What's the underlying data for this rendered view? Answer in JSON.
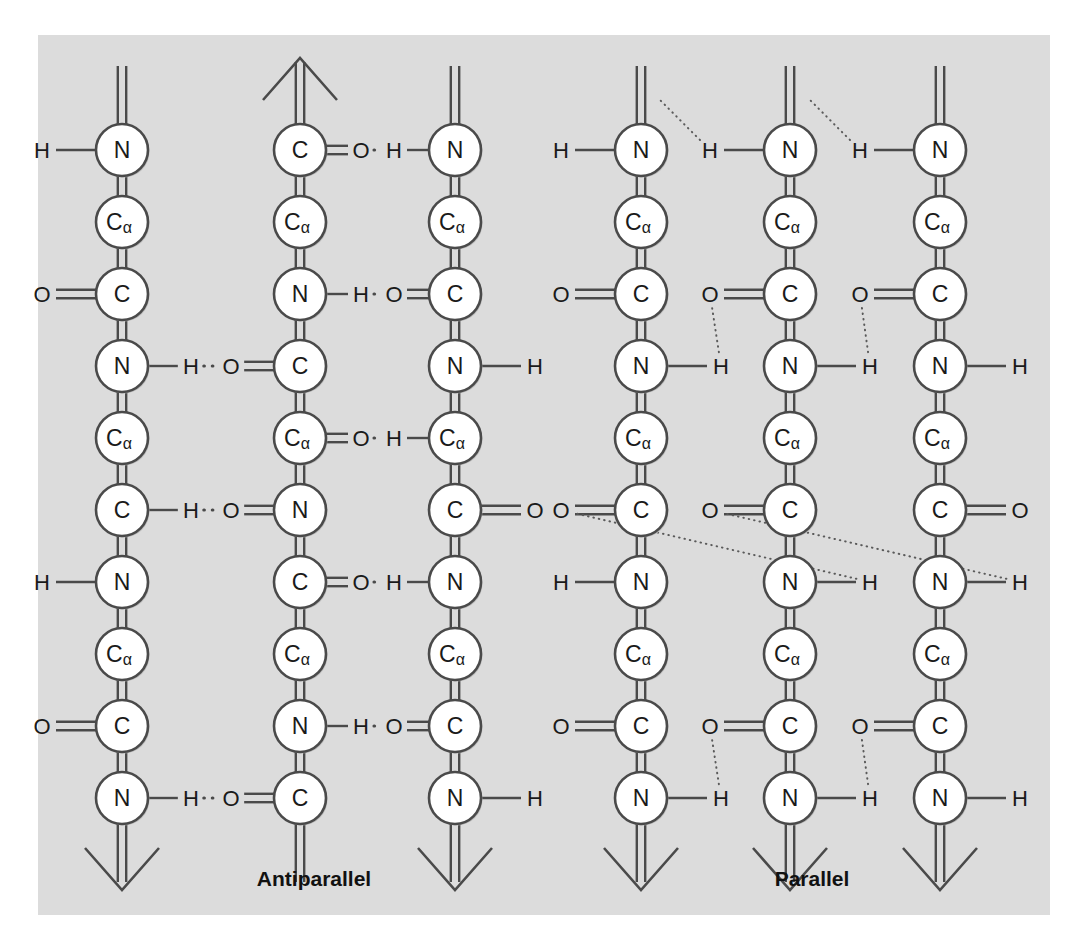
{
  "figure": {
    "background_color": "#ffffff",
    "panel_color": "#dcdcdc",
    "stroke_color": "#4a4a4a",
    "node_fill": "#ffffff",
    "text_color": "#1a1a1a"
  },
  "sections": [
    {
      "id": "antiparallel",
      "label": "Antiparallel",
      "label_x": 314,
      "label_y": 878
    },
    {
      "id": "parallel",
      "label": "Parallel",
      "label_x": 812,
      "label_y": 878
    }
  ],
  "geometry": {
    "node_radius": 26,
    "node_spacing_y": 72,
    "first_node_y": 150,
    "nodes_per_chain": 10,
    "chain_x": [
      122,
      300,
      455,
      641,
      790,
      940
    ]
  },
  "chains": [
    {
      "id": "antiparallel-chain-1",
      "section": "antiparallel",
      "x": 122,
      "direction": "down",
      "top_stub": "double-line",
      "bottom_arrow": "down",
      "nodes": [
        "N",
        "Ca",
        "C",
        "N",
        "Ca",
        "C",
        "N",
        "Ca",
        "C",
        "N"
      ]
    },
    {
      "id": "antiparallel-chain-2",
      "section": "antiparallel",
      "x": 300,
      "direction": "up",
      "top_stub": "double-line",
      "top_arrow": "up",
      "nodes": [
        "C",
        "Ca",
        "N",
        "C",
        "Ca",
        "N",
        "C",
        "Ca",
        "N",
        "C"
      ]
    },
    {
      "id": "antiparallel-chain-3",
      "section": "antiparallel",
      "x": 455,
      "direction": "down",
      "top_stub": "double-line",
      "bottom_arrow": "down",
      "nodes": [
        "N",
        "Ca",
        "C",
        "N",
        "Ca",
        "C",
        "N",
        "Ca",
        "C",
        "N"
      ]
    },
    {
      "id": "parallel-chain-1",
      "section": "parallel",
      "x": 641,
      "direction": "down",
      "top_stub": "double-line",
      "bottom_arrow": "down",
      "nodes": [
        "N",
        "Ca",
        "C",
        "N",
        "Ca",
        "C",
        "N",
        "Ca",
        "C",
        "N"
      ]
    },
    {
      "id": "parallel-chain-2",
      "section": "parallel",
      "x": 790,
      "direction": "down",
      "top_stub": "double-line",
      "bottom_arrow": "down",
      "nodes": [
        "N",
        "Ca",
        "C",
        "N",
        "Ca",
        "C",
        "N",
        "Ca",
        "C",
        "N"
      ]
    },
    {
      "id": "parallel-chain-3",
      "section": "parallel",
      "x": 940,
      "direction": "down",
      "top_stub": "double-line",
      "bottom_arrow": "down",
      "nodes": [
        "N",
        "Ca",
        "C",
        "N",
        "Ca",
        "C",
        "N",
        "Ca",
        "C",
        "N"
      ]
    }
  ],
  "substituents": [
    {
      "chain": 0,
      "node_index": 0,
      "side": "left",
      "atom": "H",
      "bond": "single"
    },
    {
      "chain": 0,
      "node_index": 2,
      "side": "left",
      "atom": "O",
      "bond": "double"
    },
    {
      "chain": 0,
      "node_index": 6,
      "side": "left",
      "atom": "H",
      "bond": "single"
    },
    {
      "chain": 0,
      "node_index": 8,
      "side": "left",
      "atom": "O",
      "bond": "double"
    },
    {
      "chain": 2,
      "node_index": 3,
      "side": "right",
      "atom": "H",
      "bond": "single"
    },
    {
      "chain": 2,
      "node_index": 5,
      "side": "right",
      "atom": "O",
      "bond": "double"
    },
    {
      "chain": 2,
      "node_index": 9,
      "side": "right",
      "atom": "H",
      "bond": "single"
    },
    {
      "chain": 3,
      "node_index": 0,
      "side": "left",
      "atom": "H",
      "bond": "single"
    },
    {
      "chain": 3,
      "node_index": 2,
      "side": "left",
      "atom": "O",
      "bond": "double"
    },
    {
      "chain": 3,
      "node_index": 6,
      "side": "left",
      "atom": "H",
      "bond": "single"
    },
    {
      "chain": 3,
      "node_index": 8,
      "side": "left",
      "atom": "O",
      "bond": "double"
    },
    {
      "chain": 5,
      "node_index": 3,
      "side": "right",
      "atom": "H",
      "bond": "single"
    },
    {
      "chain": 5,
      "node_index": 5,
      "side": "right",
      "atom": "O",
      "bond": "double"
    },
    {
      "chain": 5,
      "node_index": 9,
      "side": "right",
      "atom": "H",
      "bond": "single"
    }
  ],
  "antiparallel_hbonds": [
    {
      "left_chain": 1,
      "left_node": 0,
      "right_chain": 2,
      "right_node": 0,
      "left_atom": "O",
      "right_atom": "H",
      "left_bond": "double",
      "right_bond": "single"
    },
    {
      "left_chain": 1,
      "left_node": 2,
      "right_chain": 2,
      "right_node": 2,
      "left_atom": "H",
      "right_atom": "O",
      "left_bond": "single",
      "right_bond": "double"
    },
    {
      "left_chain": 0,
      "left_node": 3,
      "right_chain": 1,
      "right_node": 3,
      "left_atom": "H",
      "right_atom": "O",
      "left_bond": "single",
      "right_bond": "double"
    },
    {
      "left_chain": 1,
      "left_node": 4,
      "right_chain": 2,
      "right_node": 4,
      "left_atom": "O",
      "right_atom": "H",
      "left_bond": "double",
      "right_bond": "single"
    },
    {
      "left_chain": 1,
      "left_node": 6,
      "right_chain": 2,
      "right_node": 6,
      "left_atom": "O",
      "right_atom": "H",
      "left_bond": "double",
      "right_bond": "single"
    },
    {
      "left_chain": 0,
      "left_node": 5,
      "right_chain": 1,
      "right_node": 5,
      "left_atom": "H",
      "right_atom": "O",
      "left_bond": "single",
      "right_bond": "double"
    },
    {
      "left_chain": 1,
      "left_node": 8,
      "right_chain": 2,
      "right_node": 8,
      "left_atom": "H",
      "right_atom": "O",
      "left_bond": "single",
      "right_bond": "double"
    },
    {
      "left_chain": 0,
      "left_node": 9,
      "right_chain": 1,
      "right_node": 9,
      "left_atom": "H",
      "right_atom": "O",
      "left_bond": "single",
      "right_bond": "double"
    }
  ],
  "parallel_hbonds": [
    {
      "donor_chain": 4,
      "donor_node": 0,
      "acceptor": "stub-above",
      "atom": "H"
    },
    {
      "donor_chain": 5,
      "donor_node": 0,
      "acceptor": "stub-above",
      "atom": "H"
    },
    {
      "carbonyl_chain": 4,
      "carbonyl_node": 2,
      "amide_chain": 3,
      "amide_node": 3,
      "o_atom": "O",
      "h_atom": "H"
    },
    {
      "carbonyl_chain": 5,
      "carbonyl_node": 2,
      "amide_chain": 4,
      "amide_node": 3,
      "o_atom": "O",
      "h_atom": "H"
    },
    {
      "carbonyl_chain": 3,
      "carbonyl_node": 5,
      "amide_chain": 4,
      "amide_node": 6,
      "o_atom": "O",
      "h_atom": "H"
    },
    {
      "carbonyl_chain": 4,
      "carbonyl_node": 5,
      "amide_chain": 5,
      "amide_node": 6,
      "o_atom": "O",
      "h_atom": "H"
    },
    {
      "carbonyl_chain": 4,
      "carbonyl_node": 8,
      "amide_chain": 3,
      "amide_node": 9,
      "o_atom": "O",
      "h_atom": "H"
    },
    {
      "carbonyl_chain": 5,
      "carbonyl_node": 8,
      "amide_chain": 4,
      "amide_node": 9,
      "o_atom": "O",
      "h_atom": "H"
    }
  ],
  "atom_names": {
    "N": "N",
    "C": "C",
    "Ca": "Cα",
    "O": "O",
    "H": "H"
  }
}
